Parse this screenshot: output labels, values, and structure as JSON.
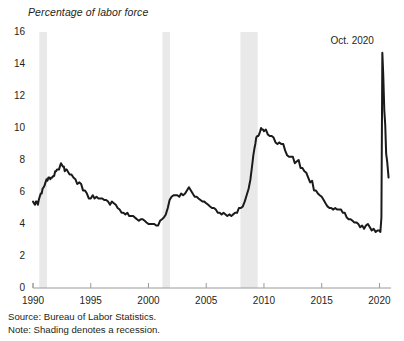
{
  "chart_data": {
    "type": "line",
    "title": "",
    "subtitle": "",
    "ylabel": "Percentage of labor force",
    "xlabel": "",
    "ylim": [
      0,
      16
    ],
    "xlim": [
      1990,
      2021
    ],
    "grid": false,
    "legend": null,
    "yticks": [
      "0",
      "2",
      "4",
      "6",
      "8",
      "10",
      "12",
      "14",
      "16"
    ],
    "ytick_values": [
      0,
      2,
      4,
      6,
      8,
      10,
      12,
      14,
      16
    ],
    "xticks": [
      "1990",
      "1995",
      "2000",
      "2005",
      "2010",
      "2015",
      "2020"
    ],
    "xtick_values": [
      1990,
      1995,
      2000,
      2005,
      2010,
      2015,
      2020
    ],
    "line_color": "#1a1a1a",
    "shading_color": "#e9e9e9",
    "annotations": [
      {
        "text": "Oct. 2020",
        "x": 2020.79,
        "y": 14.7
      }
    ],
    "shaded_regions": [
      {
        "label": "1990-91 recession",
        "x0": 1990.54,
        "x1": 1991.21
      },
      {
        "label": "2001 recession",
        "x0": 2001.21,
        "x1": 2001.87
      },
      {
        "label": "Great Recession",
        "x0": 2007.96,
        "x1": 2009.46
      }
    ],
    "series": [
      {
        "name": "Unemployment rate",
        "x": [
          1990.0,
          1990.08,
          1990.17,
          1990.25,
          1990.33,
          1990.42,
          1990.5,
          1990.58,
          1990.67,
          1990.75,
          1990.83,
          1990.92,
          1991.0,
          1991.08,
          1991.17,
          1991.25,
          1991.33,
          1991.42,
          1991.5,
          1991.58,
          1991.67,
          1991.75,
          1991.83,
          1991.92,
          1992.0,
          1992.08,
          1992.17,
          1992.25,
          1992.33,
          1992.42,
          1992.5,
          1992.58,
          1992.67,
          1992.75,
          1992.83,
          1992.92,
          1993.0,
          1993.17,
          1993.33,
          1993.5,
          1993.67,
          1993.83,
          1994.0,
          1994.17,
          1994.33,
          1994.5,
          1994.67,
          1994.83,
          1995.0,
          1995.17,
          1995.33,
          1995.5,
          1995.67,
          1995.83,
          1996.0,
          1996.17,
          1996.33,
          1996.5,
          1996.67,
          1996.83,
          1997.0,
          1997.17,
          1997.33,
          1997.5,
          1997.67,
          1997.83,
          1998.0,
          1998.17,
          1998.33,
          1998.5,
          1998.67,
          1998.83,
          1999.0,
          1999.17,
          1999.33,
          1999.5,
          1999.67,
          1999.83,
          2000.0,
          2000.17,
          2000.33,
          2000.5,
          2000.67,
          2000.83,
          2001.0,
          2001.17,
          2001.33,
          2001.5,
          2001.67,
          2001.83,
          2002.0,
          2002.17,
          2002.33,
          2002.5,
          2002.67,
          2002.83,
          2003.0,
          2003.17,
          2003.33,
          2003.5,
          2003.67,
          2003.83,
          2004.0,
          2004.17,
          2004.33,
          2004.5,
          2004.67,
          2004.83,
          2005.0,
          2005.17,
          2005.33,
          2005.5,
          2005.67,
          2005.83,
          2006.0,
          2006.17,
          2006.33,
          2006.5,
          2006.67,
          2006.83,
          2007.0,
          2007.17,
          2007.33,
          2007.5,
          2007.67,
          2007.83,
          2008.0,
          2008.17,
          2008.33,
          2008.5,
          2008.67,
          2008.83,
          2009.0,
          2009.08,
          2009.17,
          2009.25,
          2009.33,
          2009.42,
          2009.5,
          2009.58,
          2009.67,
          2009.75,
          2009.83,
          2009.92,
          2010.0,
          2010.17,
          2010.33,
          2010.5,
          2010.67,
          2010.83,
          2011.0,
          2011.17,
          2011.33,
          2011.5,
          2011.67,
          2011.83,
          2012.0,
          2012.17,
          2012.33,
          2012.5,
          2012.67,
          2012.83,
          2013.0,
          2013.17,
          2013.33,
          2013.5,
          2013.67,
          2013.83,
          2014.0,
          2014.17,
          2014.33,
          2014.5,
          2014.67,
          2014.83,
          2015.0,
          2015.17,
          2015.33,
          2015.5,
          2015.67,
          2015.83,
          2016.0,
          2016.17,
          2016.33,
          2016.5,
          2016.67,
          2016.83,
          2017.0,
          2017.17,
          2017.33,
          2017.5,
          2017.67,
          2017.83,
          2018.0,
          2018.17,
          2018.33,
          2018.5,
          2018.67,
          2018.83,
          2019.0,
          2019.17,
          2019.33,
          2019.5,
          2019.67,
          2019.83,
          2020.0,
          2020.08,
          2020.17,
          2020.25,
          2020.33,
          2020.42,
          2020.5,
          2020.58,
          2020.67,
          2020.79
        ],
        "y": [
          5.4,
          5.3,
          5.2,
          5.4,
          5.4,
          5.2,
          5.5,
          5.7,
          5.9,
          5.9,
          6.2,
          6.3,
          6.4,
          6.6,
          6.8,
          6.7,
          6.9,
          6.9,
          6.8,
          6.9,
          6.9,
          7.0,
          7.0,
          7.3,
          7.3,
          7.4,
          7.4,
          7.4,
          7.6,
          7.8,
          7.7,
          7.6,
          7.6,
          7.3,
          7.4,
          7.4,
          7.3,
          7.1,
          7.1,
          6.9,
          6.8,
          6.5,
          6.6,
          6.5,
          6.1,
          6.1,
          5.9,
          5.6,
          5.6,
          5.8,
          5.6,
          5.7,
          5.6,
          5.6,
          5.6,
          5.5,
          5.5,
          5.4,
          5.2,
          5.4,
          5.3,
          5.2,
          5.0,
          4.9,
          4.7,
          4.7,
          4.6,
          4.7,
          4.5,
          4.5,
          4.5,
          4.4,
          4.3,
          4.2,
          4.3,
          4.3,
          4.2,
          4.1,
          4.0,
          4.0,
          4.0,
          4.0,
          3.9,
          3.9,
          4.2,
          4.3,
          4.4,
          4.6,
          5.0,
          5.5,
          5.7,
          5.8,
          5.8,
          5.8,
          5.7,
          5.9,
          5.8,
          5.9,
          6.1,
          6.3,
          6.1,
          5.9,
          5.7,
          5.7,
          5.6,
          5.5,
          5.4,
          5.4,
          5.3,
          5.2,
          5.1,
          5.0,
          5.0,
          4.9,
          4.7,
          4.7,
          4.6,
          4.7,
          4.6,
          4.5,
          4.6,
          4.5,
          4.6,
          4.7,
          4.7,
          5.0,
          5.0,
          5.1,
          5.4,
          5.8,
          6.2,
          6.8,
          7.8,
          8.3,
          8.7,
          9.0,
          9.4,
          9.5,
          9.5,
          9.6,
          9.8,
          10.0,
          9.9,
          9.9,
          9.8,
          9.9,
          9.6,
          9.5,
          9.5,
          9.4,
          9.1,
          9.0,
          9.1,
          9.0,
          9.0,
          8.6,
          8.3,
          8.2,
          8.2,
          8.2,
          7.8,
          7.9,
          8.0,
          7.5,
          7.5,
          7.3,
          7.2,
          6.9,
          6.6,
          6.7,
          6.1,
          6.1,
          5.9,
          5.8,
          5.7,
          5.5,
          5.3,
          5.1,
          5.0,
          5.0,
          4.9,
          5.0,
          4.9,
          4.9,
          4.9,
          4.7,
          4.7,
          4.4,
          4.3,
          4.3,
          4.2,
          4.1,
          4.1,
          4.0,
          3.8,
          3.9,
          3.7,
          3.9,
          4.0,
          3.8,
          3.6,
          3.7,
          3.5,
          3.6,
          3.6,
          3.5,
          4.4,
          14.7,
          13.3,
          11.1,
          10.2,
          8.4,
          7.9,
          6.9
        ]
      }
    ]
  },
  "footnotes": {
    "source": "Source: Bureau of Labor Statistics.",
    "note": "Note: Shading denotes a recession."
  },
  "axis_title": "Percentage of labor force"
}
